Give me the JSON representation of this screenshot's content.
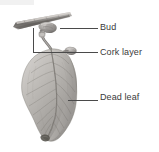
{
  "figure": {
    "background_color": "#ffffff",
    "label_color": "#3a3a3a",
    "leader_color": "#4a4a4a",
    "illustration_style": "grayscale pencil drawing",
    "top_band_color": "#f1f1f1"
  },
  "labels": [
    {
      "id": "bud",
      "text": "Bud"
    },
    {
      "id": "cork",
      "text": "Cork layer"
    },
    {
      "id": "dead",
      "text": "Dead leaf"
    }
  ],
  "illustration": {
    "twig_name": "twig-branch",
    "bud_name": "bud-on-twig",
    "petiole_name": "leaf-petiole",
    "leaf_name": "dead-leaf-blade",
    "midrib_name": "leaf-midrib",
    "twig_color": "#8f8f8f",
    "leaf_color": "#b8b5b2",
    "vein_color": "#6e6b68"
  }
}
